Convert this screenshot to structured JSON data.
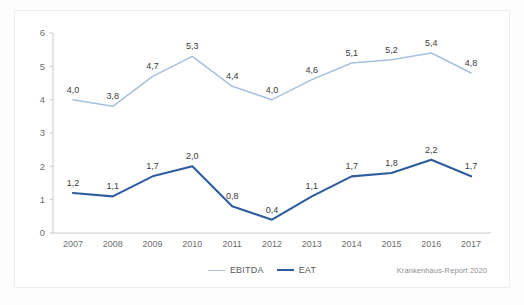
{
  "chart_data": {
    "type": "line",
    "title": "",
    "xlabel": "",
    "ylabel": "",
    "categories": [
      "2007",
      "2008",
      "2009",
      "2010",
      "2011",
      "2012",
      "2013",
      "2014",
      "2015",
      "2016",
      "2017"
    ],
    "ylim": [
      0,
      6
    ],
    "yticks": [
      "0",
      "1",
      "2",
      "3",
      "4",
      "5",
      "6"
    ],
    "grid": false,
    "legend_position": "bottom-center",
    "decimal_separator": ",",
    "series": [
      {
        "name": "EBITDA",
        "color": "#a8c0de",
        "values": [
          4.0,
          3.8,
          4.7,
          5.3,
          4.4,
          4.0,
          4.6,
          5.1,
          5.2,
          5.4,
          4.8
        ],
        "labels": [
          "4,0",
          "3,8",
          "4,7",
          "5,3",
          "4,4",
          "4,0",
          "4,6",
          "5,1",
          "5,2",
          "5,4",
          "4,8"
        ]
      },
      {
        "name": "EAT",
        "color": "#2f5c9e",
        "values": [
          1.2,
          1.1,
          1.7,
          2.0,
          0.8,
          0.4,
          1.1,
          1.7,
          1.8,
          2.2,
          1.7
        ],
        "labels": [
          "1,2",
          "1,1",
          "1,7",
          "2,0",
          "0,8",
          "0,4",
          "1,1",
          "1,7",
          "1,8",
          "2,2",
          "1,7"
        ]
      }
    ]
  },
  "legend": {
    "items": [
      {
        "label": "EBITDA"
      },
      {
        "label": "EAT"
      }
    ]
  },
  "source": {
    "note": "Krankenhaus-Report 2020"
  }
}
